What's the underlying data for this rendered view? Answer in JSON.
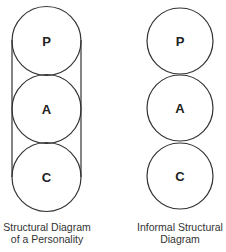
{
  "diagrams": [
    {
      "name": "structural-diagram",
      "circles": [
        "P",
        "A",
        "C"
      ],
      "enclosed": true,
      "caption": [
        "Structural Diagram",
        "of a Personality"
      ]
    },
    {
      "name": "informal-structural-diagram",
      "circles": [
        "P",
        "A",
        "C"
      ],
      "enclosed": false,
      "caption": [
        "Informal Structural",
        "Diagram"
      ]
    }
  ],
  "colors": {
    "stroke": "#333333",
    "background": "#ffffff"
  }
}
